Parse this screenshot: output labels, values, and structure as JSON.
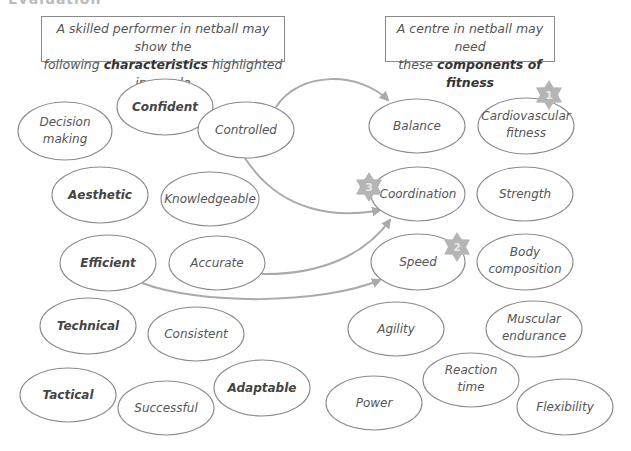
{
  "heading_clipped": "Evaluation",
  "left_box": {
    "line1": "A skilled performer in netball may show the",
    "line2_pre": "following ",
    "line2_bold": "characteristics",
    "line2_post": " highlighted in purple"
  },
  "right_box": {
    "line1": "A centre in netball may need",
    "line2_pre": "these ",
    "line2_bold": "components of fitness"
  },
  "characteristics": [
    {
      "id": "decision-making",
      "lines": [
        "Decision",
        "making"
      ],
      "bold": false
    },
    {
      "id": "confident",
      "lines": [
        "Confident"
      ],
      "bold": true
    },
    {
      "id": "controlled",
      "lines": [
        "Controlled"
      ],
      "bold": false
    },
    {
      "id": "aesthetic",
      "lines": [
        "Aesthetic"
      ],
      "bold": true
    },
    {
      "id": "knowledgeable",
      "lines": [
        "Knowledgeable"
      ],
      "bold": false
    },
    {
      "id": "efficient",
      "lines": [
        "Efficient"
      ],
      "bold": true
    },
    {
      "id": "accurate",
      "lines": [
        "Accurate"
      ],
      "bold": false
    },
    {
      "id": "technical",
      "lines": [
        "Technical"
      ],
      "bold": true
    },
    {
      "id": "consistent",
      "lines": [
        "Consistent"
      ],
      "bold": false
    },
    {
      "id": "tactical",
      "lines": [
        "Tactical"
      ],
      "bold": true
    },
    {
      "id": "successful",
      "lines": [
        "Successful"
      ],
      "bold": false
    },
    {
      "id": "adaptable",
      "lines": [
        "Adaptable"
      ],
      "bold": true
    }
  ],
  "components": [
    {
      "id": "balance",
      "lines": [
        "Balance"
      ]
    },
    {
      "id": "cardiovascular-fitness",
      "lines": [
        "Cardiovascular",
        "fitness"
      ],
      "rank": "1"
    },
    {
      "id": "coordination",
      "lines": [
        "Coordination"
      ],
      "rank": "3"
    },
    {
      "id": "strength",
      "lines": [
        "Strength"
      ]
    },
    {
      "id": "speed",
      "lines": [
        "Speed"
      ],
      "rank": "2"
    },
    {
      "id": "body-composition",
      "lines": [
        "Body",
        "composition"
      ]
    },
    {
      "id": "agility",
      "lines": [
        "Agility"
      ]
    },
    {
      "id": "muscular-endurance",
      "lines": [
        "Muscular",
        "endurance"
      ]
    },
    {
      "id": "reaction-time",
      "lines": [
        "Reaction",
        "time"
      ]
    },
    {
      "id": "power",
      "lines": [
        "Power"
      ]
    },
    {
      "id": "flexibility",
      "lines": [
        "Flexibility"
      ]
    }
  ],
  "arrows": [
    {
      "from": "Controlled",
      "to": "Balance"
    },
    {
      "from": "Controlled",
      "to": "Coordination"
    },
    {
      "from": "Accurate",
      "to": "Coordination"
    },
    {
      "from": "Efficient",
      "to": "Speed"
    }
  ],
  "colors": {
    "outline": "#8c8c8c",
    "arrow": "#aaaaaa",
    "star": "#b5b5b5"
  }
}
